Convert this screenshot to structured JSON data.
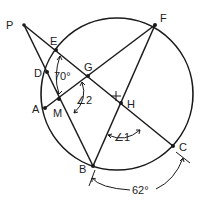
{
  "diagram": {
    "type": "circle-geometry",
    "circle": {
      "cx": 117,
      "cy": 94,
      "r": 76
    },
    "center_mark": {
      "x": 116,
      "y": 96
    },
    "points": [
      {
        "id": "P",
        "label": "P",
        "x": 24,
        "y": 25,
        "lx": 6,
        "ly": 28
      },
      {
        "id": "E",
        "label": "E",
        "x": 56,
        "y": 50,
        "lx": 50,
        "ly": 45
      },
      {
        "id": "D",
        "label": "D",
        "x": 47,
        "y": 72,
        "lx": 34,
        "ly": 76
      },
      {
        "id": "G",
        "label": "G",
        "x": 88,
        "y": 76,
        "lx": 84,
        "ly": 71
      },
      {
        "id": "A",
        "label": "A",
        "x": 45,
        "y": 108,
        "lx": 32,
        "ly": 113
      },
      {
        "id": "M",
        "label": "M",
        "x": 59,
        "y": 99,
        "lx": 53,
        "ly": 117
      },
      {
        "id": "H",
        "label": "H",
        "x": 121,
        "y": 103,
        "lx": 127,
        "ly": 107
      },
      {
        "id": "B",
        "label": "B",
        "x": 93,
        "y": 166,
        "lx": 78,
        "ly": 172
      },
      {
        "id": "C",
        "label": "C",
        "x": 173,
        "y": 146,
        "lx": 180,
        "ly": 151
      },
      {
        "id": "F",
        "label": "F",
        "x": 155,
        "y": 25,
        "lx": 160,
        "ly": 22
      }
    ],
    "segments": [
      {
        "from": "P",
        "to": "C"
      },
      {
        "from": "P",
        "to": "B"
      },
      {
        "from": "A",
        "to": "F"
      },
      {
        "from": "B",
        "to": "F"
      }
    ],
    "annotations": {
      "angle_70": {
        "text": "70°"
      },
      "angle_2": {
        "text": "∠2"
      },
      "angle_1": {
        "text": "∠1"
      },
      "arc_62": {
        "text": "62°"
      }
    }
  }
}
